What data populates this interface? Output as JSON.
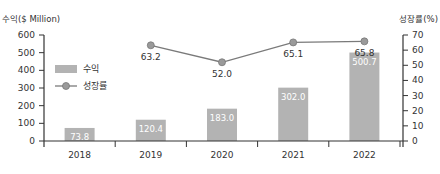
{
  "chart_data": {
    "type": "bar+line",
    "title": "",
    "categories": [
      "2018",
      "2019",
      "2020",
      "2021",
      "2022"
    ],
    "series": [
      {
        "name": "수익",
        "type": "bar",
        "axis": "left",
        "values": [
          73.8,
          120.4,
          183.0,
          302.0,
          500.7
        ],
        "labels": [
          "73.8",
          "120.4",
          "183.0",
          "302.0",
          "500.7"
        ],
        "color": "#b3b3b3"
      },
      {
        "name": "성장률",
        "type": "line",
        "axis": "right",
        "values": [
          null,
          63.2,
          52.0,
          65.1,
          65.8
        ],
        "labels": [
          "",
          "63.2",
          "52.0",
          "65.1",
          "65.8"
        ],
        "color": "#7a7a7a"
      }
    ],
    "left_axis": {
      "label": "수익($ Million)",
      "min": 0,
      "max": 600,
      "ticks": [
        "0",
        "100",
        "200",
        "300",
        "400",
        "500",
        "600"
      ]
    },
    "right_axis": {
      "label": "성장률(%)",
      "min": 0,
      "max": 70,
      "ticks": [
        "0",
        "10",
        "20",
        "30",
        "40",
        "50",
        "60",
        "70"
      ]
    },
    "legend": {
      "position": "upper-left-inside",
      "entries": [
        "수익",
        "성장률"
      ]
    },
    "grid": false
  },
  "legend": {
    "bar_label": "수익",
    "line_label": "성장률"
  },
  "axes": {
    "left_title": "수익($ Million)",
    "right_title": "성장률(%)"
  }
}
